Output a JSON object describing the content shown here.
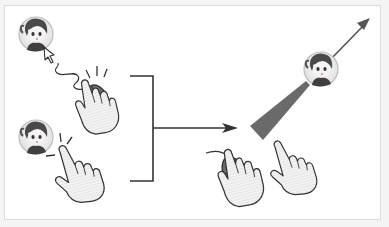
{
  "diagram": {
    "left_group": {
      "top": {
        "actor": "character-avatar",
        "input": "mouse-click",
        "cursor": "arrow-pointer"
      },
      "bottom": {
        "actor": "character-avatar",
        "input": "finger-tap"
      }
    },
    "connector": {
      "type": "bracket-arrow",
      "direction": "right"
    },
    "right_group": {
      "actor": "character-avatar",
      "effect": "aim-cone-with-direction-arrow",
      "inputs": [
        "mouse-drag",
        "finger-drag"
      ]
    },
    "colors": {
      "background": "#ffffff",
      "border": "#dcdcdc",
      "line": "#333333",
      "mouse_body": "#6b6b6b",
      "cone": "#6a6a6a",
      "hand_fill": "#ececec"
    }
  }
}
